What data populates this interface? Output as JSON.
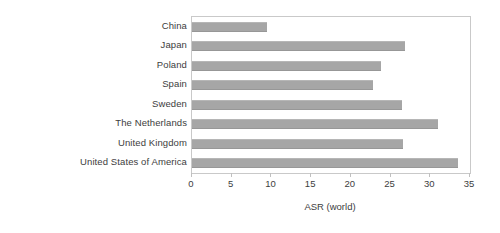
{
  "chart_data": {
    "type": "bar",
    "orientation": "horizontal",
    "title": "",
    "xlabel": "ASR (world)",
    "ylabel": "",
    "xlim": [
      0,
      35
    ],
    "xticks": [
      0,
      5,
      10,
      15,
      20,
      25,
      30,
      35
    ],
    "xtick_labels": [
      "0",
      "5",
      "10",
      "15",
      "20",
      "25",
      "30",
      "35"
    ],
    "grid": false,
    "legend": null,
    "bar_color": "#a6a6a6",
    "frame_color": "#c9c9c9",
    "text_color": "#3d3d3d",
    "categories": [
      "China",
      "Japan",
      "Poland",
      "Spain",
      "Sweden",
      "The Netherlands",
      "United Kingdom",
      "United States of America"
    ],
    "values": [
      9.5,
      26.8,
      23.8,
      22.8,
      26.4,
      31.0,
      26.6,
      33.5
    ]
  }
}
